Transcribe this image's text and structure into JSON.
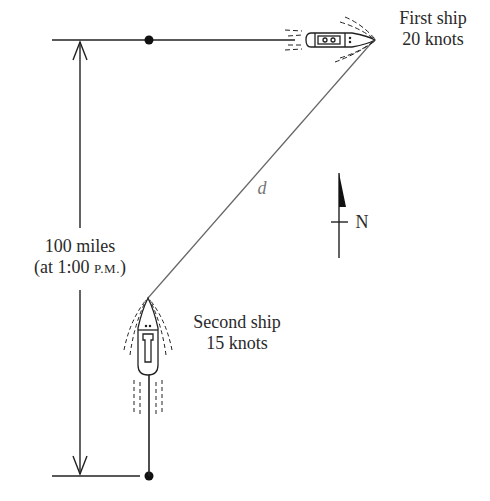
{
  "first_ship": {
    "name": "First ship",
    "speed": "20 knots"
  },
  "second_ship": {
    "name": "Second ship",
    "speed": "15 knots"
  },
  "distance": {
    "line1": "100 miles",
    "line2_prefix": "(at 1:00 ",
    "line2_time": "P.M.",
    "line2_suffix": ")"
  },
  "d_label": "d",
  "compass": {
    "label": "N"
  },
  "colors": {
    "ink": "#222222",
    "line": "#555555"
  }
}
